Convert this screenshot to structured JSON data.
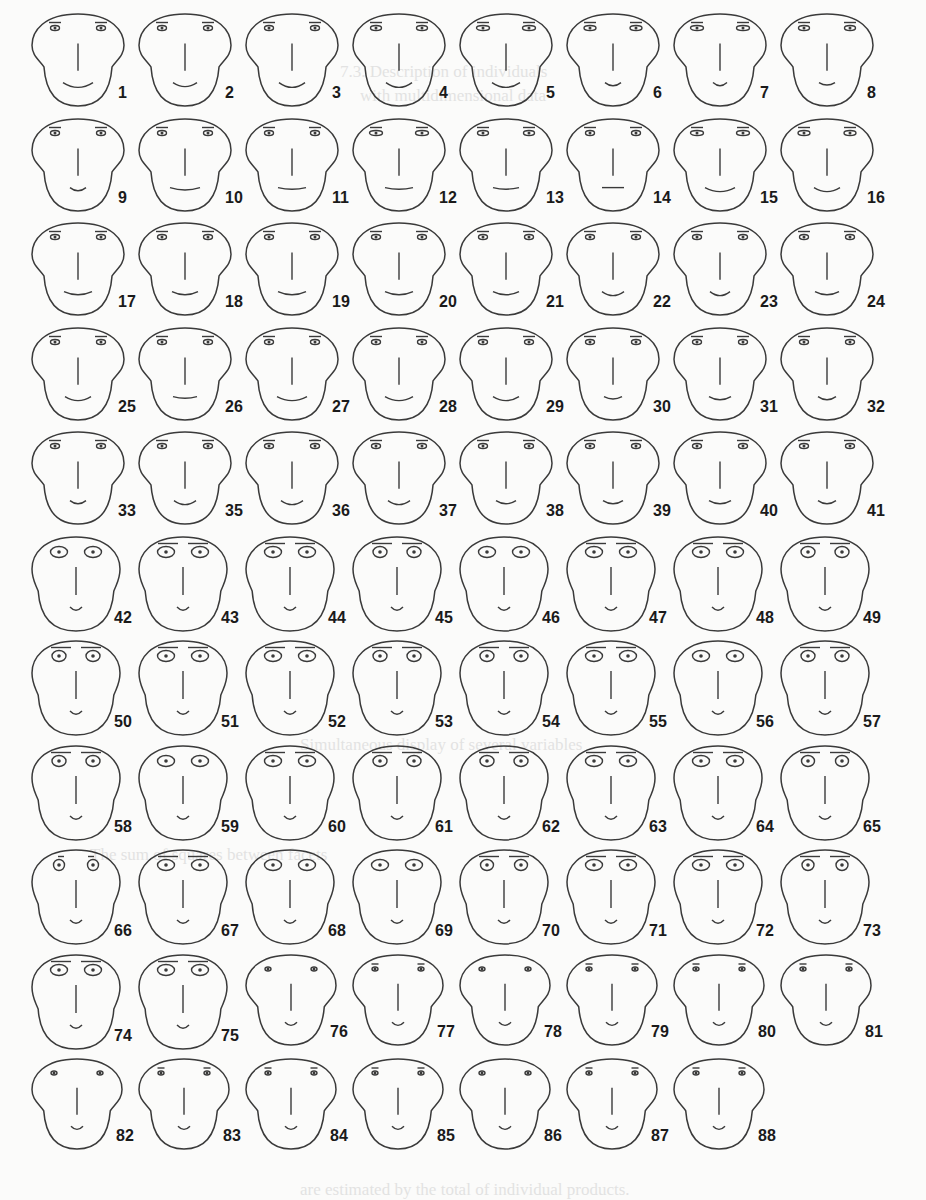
{
  "figure": {
    "type": "chernoff-faces",
    "columns": 8,
    "origin": {
      "x": 30,
      "y": 8
    },
    "cell": {
      "w": 107,
      "h": 104.5
    },
    "ink": "#3a3a3a",
    "background": "#fbfbfa"
  },
  "groups": {
    "A": {
      "rows": [
        0,
        1,
        2,
        3,
        4
      ],
      "eye_w": 9,
      "eye_h": 5,
      "brow_w": 12,
      "jowl": 1,
      "mouth_w": 30,
      "mouth_curve": 6,
      "head_w": 92,
      "head_h": 98
    },
    "B": {
      "rows": [
        5,
        6,
        7,
        8
      ],
      "eye_w": 17,
      "eye_h": 11,
      "brow_w": 40,
      "jowl": 0.55,
      "mouth_w": 12,
      "mouth_curve": 4,
      "head_w": 88,
      "head_h": 100
    },
    "C": {
      "rows": [
        9
      ],
      "eye_w": 17,
      "eye_h": 11,
      "brow_w": 40,
      "jowl": 0.55,
      "mouth_w": 12,
      "mouth_curve": 4,
      "head_w": 88,
      "head_h": 100
    },
    "D": {
      "rows": [
        10
      ],
      "eye_w": 6,
      "eye_h": 4,
      "brow_w": 7,
      "jowl": 1,
      "mouth_w": 12,
      "mouth_curve": 4,
      "head_w": 90,
      "head_h": 96
    }
  },
  "faces": [
    {
      "n": "1",
      "row": 0,
      "col": 0,
      "g": "A",
      "mouth_w": 30,
      "mouth_curve": 6
    },
    {
      "n": "2",
      "row": 0,
      "col": 1,
      "g": "A",
      "mouth_w": 24,
      "mouth_curve": 5
    },
    {
      "n": "3",
      "row": 0,
      "col": 2,
      "g": "A",
      "mouth_w": 26,
      "mouth_curve": 6
    },
    {
      "n": "4",
      "row": 0,
      "col": 3,
      "g": "A",
      "mouth_w": 26,
      "mouth_curve": 6,
      "eye_w": 11
    },
    {
      "n": "5",
      "row": 0,
      "col": 4,
      "g": "A",
      "mouth_w": 28,
      "mouth_curve": 6,
      "eye_w": 13
    },
    {
      "n": "6",
      "row": 0,
      "col": 5,
      "g": "A",
      "mouth_w": 16,
      "mouth_curve": 4,
      "eye_w": 12
    },
    {
      "n": "7",
      "row": 0,
      "col": 6,
      "g": "A",
      "mouth_w": 14,
      "mouth_curve": 4,
      "eye_w": 13
    },
    {
      "n": "8",
      "row": 0,
      "col": 7,
      "g": "A",
      "mouth_w": 16,
      "mouth_curve": 3,
      "eye_w": 11
    },
    {
      "n": "9",
      "row": 1,
      "col": 0,
      "g": "A",
      "mouth_w": 16,
      "mouth_curve": 4
    },
    {
      "n": "10",
      "row": 1,
      "col": 1,
      "g": "A",
      "mouth_w": 30,
      "mouth_curve": 3
    },
    {
      "n": "11",
      "row": 1,
      "col": 2,
      "g": "A",
      "mouth_w": 28,
      "mouth_curve": 2
    },
    {
      "n": "12",
      "row": 1,
      "col": 3,
      "g": "A",
      "mouth_w": 28,
      "mouth_curve": 2,
      "eye_w": 13
    },
    {
      "n": "13",
      "row": 1,
      "col": 4,
      "g": "A",
      "mouth_w": 26,
      "mouth_curve": 2,
      "eye_w": 11
    },
    {
      "n": "14",
      "row": 1,
      "col": 5,
      "g": "A",
      "mouth_w": 22,
      "mouth_curve": 0
    },
    {
      "n": "15",
      "row": 1,
      "col": 6,
      "g": "A",
      "mouth_w": 30,
      "mouth_curve": 5,
      "eye_w": 13
    },
    {
      "n": "16",
      "row": 1,
      "col": 7,
      "g": "A",
      "mouth_w": 26,
      "mouth_curve": 5,
      "eye_w": 12
    },
    {
      "n": "17",
      "row": 2,
      "col": 0,
      "g": "A",
      "mouth_w": 28,
      "mouth_curve": 4
    },
    {
      "n": "18",
      "row": 2,
      "col": 1,
      "g": "A",
      "mouth_w": 26,
      "mouth_curve": 4
    },
    {
      "n": "19",
      "row": 2,
      "col": 2,
      "g": "A",
      "mouth_w": 28,
      "mouth_curve": 4
    },
    {
      "n": "20",
      "row": 2,
      "col": 3,
      "g": "A",
      "mouth_w": 28,
      "mouth_curve": 4
    },
    {
      "n": "21",
      "row": 2,
      "col": 4,
      "g": "A",
      "mouth_w": 26,
      "mouth_curve": 4
    },
    {
      "n": "22",
      "row": 2,
      "col": 5,
      "g": "A",
      "mouth_w": 22,
      "mouth_curve": 5
    },
    {
      "n": "23",
      "row": 2,
      "col": 6,
      "g": "A",
      "mouth_w": 20,
      "mouth_curve": 5
    },
    {
      "n": "24",
      "row": 2,
      "col": 7,
      "g": "A",
      "mouth_w": 24,
      "mouth_curve": 4
    },
    {
      "n": "25",
      "row": 3,
      "col": 0,
      "g": "A",
      "mouth_w": 26,
      "mouth_curve": 5
    },
    {
      "n": "26",
      "row": 3,
      "col": 1,
      "g": "A",
      "mouth_w": 24,
      "mouth_curve": 2
    },
    {
      "n": "27",
      "row": 3,
      "col": 2,
      "g": "A",
      "mouth_w": 30,
      "mouth_curve": 5
    },
    {
      "n": "28",
      "row": 3,
      "col": 3,
      "g": "A",
      "mouth_w": 28,
      "mouth_curve": 5
    },
    {
      "n": "29",
      "row": 3,
      "col": 4,
      "g": "A",
      "mouth_w": 26,
      "mouth_curve": 5
    },
    {
      "n": "30",
      "row": 3,
      "col": 5,
      "g": "A",
      "mouth_w": 18,
      "mouth_curve": 3
    },
    {
      "n": "31",
      "row": 3,
      "col": 6,
      "g": "A",
      "mouth_w": 22,
      "mouth_curve": 4
    },
    {
      "n": "32",
      "row": 3,
      "col": 7,
      "g": "A",
      "mouth_w": 18,
      "mouth_curve": 4
    },
    {
      "n": "33",
      "row": 4,
      "col": 0,
      "g": "A",
      "mouth_w": 16,
      "mouth_curve": 4
    },
    {
      "n": "35",
      "row": 4,
      "col": 1,
      "g": "A",
      "mouth_w": 22,
      "mouth_curve": 5
    },
    {
      "n": "36",
      "row": 4,
      "col": 2,
      "g": "A",
      "mouth_w": 22,
      "mouth_curve": 5
    },
    {
      "n": "37",
      "row": 4,
      "col": 3,
      "g": "A",
      "mouth_w": 22,
      "mouth_curve": 5
    },
    {
      "n": "38",
      "row": 4,
      "col": 4,
      "g": "A",
      "mouth_w": 20,
      "mouth_curve": 4
    },
    {
      "n": "39",
      "row": 4,
      "col": 5,
      "g": "A",
      "mouth_w": 20,
      "mouth_curve": 4
    },
    {
      "n": "40",
      "row": 4,
      "col": 6,
      "g": "A",
      "mouth_w": 22,
      "mouth_curve": 4
    },
    {
      "n": "41",
      "row": 4,
      "col": 7,
      "g": "A",
      "mouth_w": 18,
      "mouth_curve": 4
    },
    {
      "n": "42",
      "row": 5,
      "col": 0,
      "g": "B",
      "brow_w": 0
    },
    {
      "n": "43",
      "row": 5,
      "col": 1,
      "g": "B"
    },
    {
      "n": "44",
      "row": 5,
      "col": 2,
      "g": "B"
    },
    {
      "n": "45",
      "row": 5,
      "col": 3,
      "g": "B",
      "eye_w": 14
    },
    {
      "n": "46",
      "row": 5,
      "col": 4,
      "g": "B",
      "brow_w": 0
    },
    {
      "n": "47",
      "row": 5,
      "col": 5,
      "g": "B"
    },
    {
      "n": "48",
      "row": 5,
      "col": 6,
      "g": "B"
    },
    {
      "n": "49",
      "row": 5,
      "col": 7,
      "g": "B",
      "eye_w": 14
    },
    {
      "n": "50",
      "row": 6,
      "col": 0,
      "g": "B",
      "eye_w": 14
    },
    {
      "n": "51",
      "row": 6,
      "col": 1,
      "g": "B"
    },
    {
      "n": "52",
      "row": 6,
      "col": 2,
      "g": "B"
    },
    {
      "n": "53",
      "row": 6,
      "col": 3,
      "g": "B",
      "eye_w": 14
    },
    {
      "n": "54",
      "row": 6,
      "col": 4,
      "g": "B",
      "eye_w": 14
    },
    {
      "n": "55",
      "row": 6,
      "col": 5,
      "g": "B"
    },
    {
      "n": "56",
      "row": 6,
      "col": 6,
      "g": "B",
      "brow_w": 0
    },
    {
      "n": "57",
      "row": 6,
      "col": 7,
      "g": "B",
      "eye_w": 14
    },
    {
      "n": "58",
      "row": 7,
      "col": 0,
      "g": "B",
      "eye_w": 14
    },
    {
      "n": "59",
      "row": 7,
      "col": 1,
      "g": "B",
      "brow_w": 0
    },
    {
      "n": "60",
      "row": 7,
      "col": 2,
      "g": "B"
    },
    {
      "n": "61",
      "row": 7,
      "col": 3,
      "g": "B",
      "eye_w": 14
    },
    {
      "n": "62",
      "row": 7,
      "col": 4,
      "g": "B",
      "eye_w": 14
    },
    {
      "n": "63",
      "row": 7,
      "col": 5,
      "g": "B"
    },
    {
      "n": "64",
      "row": 7,
      "col": 6,
      "g": "B"
    },
    {
      "n": "65",
      "row": 7,
      "col": 7,
      "g": "B",
      "eye_w": 13
    },
    {
      "n": "66",
      "row": 8,
      "col": 0,
      "g": "B",
      "eye_w": 11,
      "brow_w": 12
    },
    {
      "n": "67",
      "row": 8,
      "col": 1,
      "g": "B"
    },
    {
      "n": "68",
      "row": 8,
      "col": 2,
      "g": "B",
      "brow_w": 0
    },
    {
      "n": "69",
      "row": 8,
      "col": 3,
      "g": "B",
      "brow_w": 0
    },
    {
      "n": "70",
      "row": 8,
      "col": 4,
      "g": "B",
      "eye_w": 13
    },
    {
      "n": "71",
      "row": 8,
      "col": 5,
      "g": "B"
    },
    {
      "n": "72",
      "row": 8,
      "col": 6,
      "g": "B"
    },
    {
      "n": "73",
      "row": 8,
      "col": 7,
      "g": "B",
      "eye_w": 12
    },
    {
      "n": "74",
      "row": 9,
      "col": 0,
      "g": "C"
    },
    {
      "n": "75",
      "row": 9,
      "col": 1,
      "g": "C"
    },
    {
      "n": "76",
      "row": 9,
      "col": 2,
      "g": "D",
      "brow_w": 0
    },
    {
      "n": "77",
      "row": 9,
      "col": 3,
      "g": "D"
    },
    {
      "n": "78",
      "row": 9,
      "col": 4,
      "g": "D",
      "brow_w": 0
    },
    {
      "n": "79",
      "row": 9,
      "col": 5,
      "g": "D"
    },
    {
      "n": "80",
      "row": 9,
      "col": 6,
      "g": "D"
    },
    {
      "n": "81",
      "row": 9,
      "col": 7,
      "g": "D"
    },
    {
      "n": "82",
      "row": 10,
      "col": 0,
      "g": "D",
      "brow_w": 0
    },
    {
      "n": "83",
      "row": 10,
      "col": 1,
      "g": "D"
    },
    {
      "n": "84",
      "row": 10,
      "col": 2,
      "g": "D"
    },
    {
      "n": "85",
      "row": 10,
      "col": 3,
      "g": "D"
    },
    {
      "n": "86",
      "row": 10,
      "col": 4,
      "g": "D",
      "brow_w": 0
    },
    {
      "n": "87",
      "row": 10,
      "col": 5,
      "g": "D"
    },
    {
      "n": "88",
      "row": 10,
      "col": 6,
      "g": "D"
    }
  ],
  "bleed_through_text": [
    {
      "text": "7.3. Description of individuals",
      "x": 340,
      "y": 62
    },
    {
      "text": "with multidimensional data",
      "x": 360,
      "y": 86
    },
    {
      "text": "Simultaneous display of several variables",
      "x": 300,
      "y": 735
    },
    {
      "text": "The sum of squares between facets",
      "x": 90,
      "y": 845
    },
    {
      "text": "are estimated by the total of individual products.",
      "x": 300,
      "y": 1180
    }
  ]
}
